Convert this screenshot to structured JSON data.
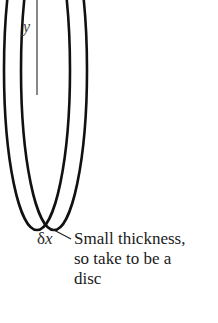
{
  "diagram": {
    "labels": {
      "y_axis": "y",
      "thickness_symbol": "δ",
      "thickness_var": "x"
    },
    "annotation": {
      "lines": [
        "Small thickness,",
        "so take to be a",
        "disc"
      ]
    },
    "colors": {
      "stroke": "#111111",
      "axis": "#555555",
      "text": "#1a1a1a"
    }
  }
}
